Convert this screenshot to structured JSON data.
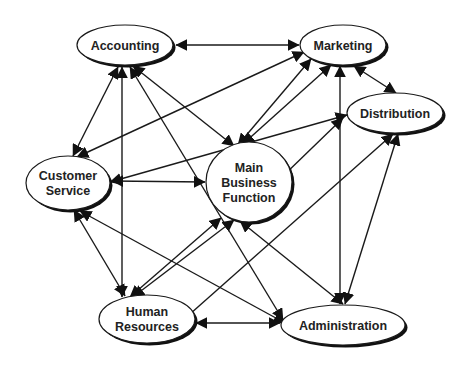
{
  "diagram": {
    "type": "network",
    "colors": {
      "line": "#1a1a1a",
      "node_fill": "#ffffff",
      "text": "#222222",
      "background": "#ffffff"
    },
    "nodes": [
      {
        "id": "accounting",
        "lines": [
          "Accounting"
        ],
        "cx": 125,
        "cy": 45,
        "rx": 48,
        "ry": 20
      },
      {
        "id": "marketing",
        "lines": [
          "Marketing"
        ],
        "cx": 343,
        "cy": 45,
        "rx": 43,
        "ry": 20
      },
      {
        "id": "distribution",
        "lines": [
          "Distribution"
        ],
        "cx": 395,
        "cy": 113,
        "rx": 48,
        "ry": 20
      },
      {
        "id": "customer-service",
        "lines": [
          "Customer",
          "Service"
        ],
        "cx": 68,
        "cy": 183,
        "rx": 42,
        "ry": 27
      },
      {
        "id": "main-business-function",
        "lines": [
          "Main",
          "Business",
          "Function"
        ],
        "cx": 249,
        "cy": 182,
        "rx": 43,
        "ry": 40
      },
      {
        "id": "human-resources",
        "lines": [
          "Human",
          "Resources"
        ],
        "cx": 147,
        "cy": 319,
        "rx": 48,
        "ry": 24
      },
      {
        "id": "administration",
        "lines": [
          "Administration"
        ],
        "cx": 343,
        "cy": 325,
        "rx": 62,
        "ry": 20
      }
    ],
    "edges": [
      {
        "from": "accounting",
        "to": "marketing",
        "x1": 176,
        "y1": 45,
        "x2": 299,
        "y2": 45,
        "start_arrow": true,
        "end_arrow": true
      },
      {
        "from": "accounting",
        "to": "customer-service",
        "x1": 118,
        "y1": 67,
        "x2": 73,
        "y2": 156,
        "start_arrow": true,
        "end_arrow": true
      },
      {
        "from": "accounting",
        "to": "human-resources",
        "x1": 122,
        "y1": 67,
        "x2": 122,
        "y2": 297,
        "start_arrow": true,
        "end_arrow": true
      },
      {
        "from": "accounting",
        "to": "main-business-function",
        "x1": 133,
        "y1": 66,
        "x2": 234,
        "y2": 146,
        "start_arrow": true,
        "end_arrow": true
      },
      {
        "from": "accounting",
        "to": "administration",
        "x1": 130,
        "y1": 67,
        "x2": 283,
        "y2": 320,
        "start_arrow": true,
        "end_arrow": true
      },
      {
        "from": "marketing",
        "to": "customer-service",
        "x1": 304,
        "y1": 52,
        "x2": 77,
        "y2": 157,
        "start_arrow": true,
        "end_arrow": true
      },
      {
        "from": "marketing",
        "to": "main-business-function",
        "x1": 311,
        "y1": 59,
        "x2": 238,
        "y2": 145,
        "start_arrow": true,
        "end_arrow": true
      },
      {
        "from": "marketing",
        "to": "main-business-function",
        "x1": 331,
        "y1": 65,
        "x2": 243,
        "y2": 144,
        "start_arrow": true,
        "end_arrow": true
      },
      {
        "from": "marketing",
        "to": "distribution",
        "x1": 354,
        "y1": 66,
        "x2": 396,
        "y2": 93,
        "start_arrow": true,
        "end_arrow": true
      },
      {
        "from": "marketing",
        "to": "administration",
        "x1": 340,
        "y1": 66,
        "x2": 340,
        "y2": 304,
        "start_arrow": true,
        "end_arrow": true
      },
      {
        "from": "distribution",
        "to": "customer-service",
        "x1": 347,
        "y1": 115,
        "x2": 110,
        "y2": 182,
        "start_arrow": true,
        "end_arrow": true
      },
      {
        "from": "distribution",
        "to": "main-business-function",
        "x1": 343,
        "y1": 118,
        "x2": 281,
        "y2": 178,
        "start_arrow": true,
        "end_arrow": true
      },
      {
        "from": "distribution",
        "to": "human-resources",
        "x1": 393,
        "y1": 134,
        "x2": 181,
        "y2": 322,
        "start_arrow": true,
        "end_arrow": true
      },
      {
        "from": "distribution",
        "to": "administration",
        "x1": 398,
        "y1": 134,
        "x2": 345,
        "y2": 304,
        "start_arrow": true,
        "end_arrow": true
      },
      {
        "from": "customer-service",
        "to": "main-business-function",
        "x1": 112,
        "y1": 181,
        "x2": 205,
        "y2": 182,
        "start_arrow": true,
        "end_arrow": true
      },
      {
        "from": "customer-service",
        "to": "human-resources",
        "x1": 74,
        "y1": 210,
        "x2": 125,
        "y2": 296,
        "start_arrow": true,
        "end_arrow": true
      },
      {
        "from": "customer-service",
        "to": "administration",
        "x1": 80,
        "y1": 211,
        "x2": 285,
        "y2": 323,
        "start_arrow": true,
        "end_arrow": true
      },
      {
        "from": "main-business-function",
        "to": "human-resources",
        "x1": 221,
        "y1": 218,
        "x2": 130,
        "y2": 297,
        "start_arrow": true,
        "end_arrow": true
      },
      {
        "from": "main-business-function",
        "to": "human-resources",
        "x1": 234,
        "y1": 220,
        "x2": 133,
        "y2": 297,
        "start_arrow": true,
        "end_arrow": true
      },
      {
        "from": "main-business-function",
        "to": "administration",
        "x1": 240,
        "y1": 221,
        "x2": 343,
        "y2": 304,
        "start_arrow": true,
        "end_arrow": true
      },
      {
        "from": "human-resources",
        "to": "administration",
        "x1": 196,
        "y1": 323,
        "x2": 280,
        "y2": 323,
        "start_arrow": true,
        "end_arrow": true
      }
    ]
  }
}
